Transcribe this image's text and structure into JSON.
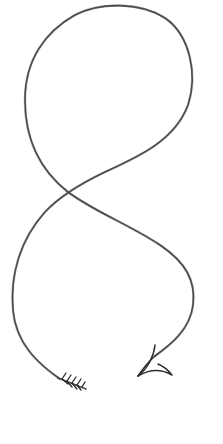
{
  "drawing": {
    "description": "Hand-drawn pencil sketch of a looping figure-eight arrow",
    "style": "pencil sketch",
    "stroke_color": "#4a4a4a",
    "background_color": "#ffffff",
    "elements": {
      "tail": "fletching",
      "body": "figure-eight loop",
      "head": "arrowhead"
    }
  }
}
